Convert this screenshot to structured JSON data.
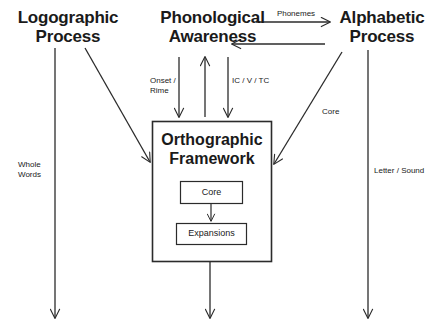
{
  "diagram": {
    "title_nodes": [
      {
        "id": "logographic",
        "label": "Logographic\nProcess"
      },
      {
        "id": "phonological",
        "label": "Phonological\nAwareness"
      },
      {
        "id": "alphabetic",
        "label": "Alphabetic\nProcess"
      }
    ],
    "main_box": {
      "title": "Orthographic\nFramework",
      "inner_boxes": [
        {
          "id": "core",
          "label": "Core"
        },
        {
          "id": "expansions",
          "label": "Expansions"
        }
      ]
    },
    "edge_labels": [
      {
        "id": "phonemes",
        "text": "Phonemes"
      },
      {
        "id": "onset-rime",
        "text": "Onset /\nRime"
      },
      {
        "id": "ic-v-tc",
        "text": "IC / V / TC"
      },
      {
        "id": "core-edge",
        "text": "Core"
      },
      {
        "id": "whole-words",
        "text": "Whole\nWords"
      },
      {
        "id": "letter-sound",
        "text": "Letter / Sound"
      }
    ],
    "colors": {
      "background": "#ffffff",
      "stroke": "#2b2b2b",
      "text": "#1a1a1a"
    }
  }
}
